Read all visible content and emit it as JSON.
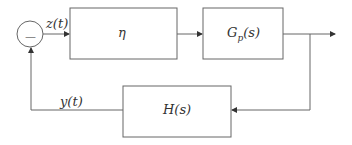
{
  "diagram": {
    "type": "feedback-control-block-diagram",
    "summing_junction": {
      "sign": "—"
    },
    "signals": {
      "error": "z(t)",
      "feedback": "y(t)"
    },
    "blocks": [
      {
        "id": "controller",
        "label": "η"
      },
      {
        "id": "plant",
        "label": "Gp(s)",
        "base": "G",
        "sub": "p",
        "tail": "(s)"
      },
      {
        "id": "feedback",
        "label": "H(s)"
      }
    ],
    "colors": {
      "line": "#555555",
      "background": "#ffffff"
    }
  }
}
